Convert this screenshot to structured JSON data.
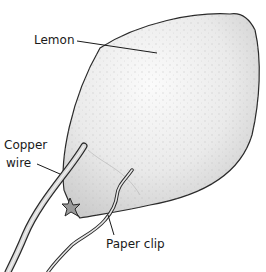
{
  "labels": {
    "lemon": "Lemon",
    "copper_line1": "Copper",
    "copper_line2": "wire",
    "paper_clip": "Paper clip"
  },
  "colors": {
    "background": "#ffffff",
    "lemon_fill": "#ececec",
    "lemon_highlight": "#f8f8f8",
    "lemon_shadow": "#c9c9c9",
    "outline": "#2a2a2a",
    "wire_fill": "#d6d6d6",
    "star_fill": "#9a9a9a"
  }
}
